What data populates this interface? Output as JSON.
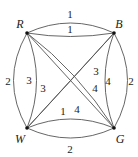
{
  "diagram": {
    "type": "weighted multigraph",
    "vertices": [
      {
        "id": "R",
        "label": "R",
        "x": 27,
        "y": 33,
        "lx": 20,
        "ly": 24
      },
      {
        "id": "B",
        "label": "B",
        "x": 114,
        "y": 33,
        "lx": 119,
        "ly": 24
      },
      {
        "id": "W",
        "label": "W",
        "x": 27,
        "y": 128,
        "lx": 20,
        "ly": 138
      },
      {
        "id": "G",
        "label": "G",
        "x": 114,
        "y": 128,
        "lx": 120,
        "ly": 138
      }
    ],
    "edges": [
      {
        "from": "R",
        "to": "B",
        "weight": "1",
        "kind": "outer-top"
      },
      {
        "from": "R",
        "to": "B",
        "weight": "1",
        "kind": "inner-top"
      },
      {
        "from": "R",
        "to": "W",
        "weight": "2",
        "kind": "outer-left"
      },
      {
        "from": "R",
        "to": "W",
        "weight": "3",
        "kind": "inner-left"
      },
      {
        "from": "B",
        "to": "G",
        "weight": "2",
        "kind": "outer-right"
      },
      {
        "from": "B",
        "to": "G",
        "weight": "4",
        "kind": "inner-right"
      },
      {
        "from": "W",
        "to": "G",
        "weight": "2",
        "kind": "outer-bottom"
      },
      {
        "from": "W",
        "to": "G",
        "weight": "1",
        "kind": "inner-bottom"
      },
      {
        "from": "R",
        "to": "G",
        "weight": "4",
        "kind": "diagonal-a"
      },
      {
        "from": "R",
        "to": "G",
        "weight": "4",
        "kind": "diagonal-b"
      },
      {
        "from": "B",
        "to": "W",
        "weight": "3",
        "kind": "diagonal-a"
      },
      {
        "from": "B",
        "to": "W",
        "weight": "3",
        "kind": "diagonal-b"
      }
    ],
    "labels": {
      "top_outer": "1",
      "top_inner": "1",
      "left_outer": "2",
      "left_inner": "3",
      "right_outer": "2",
      "right_inner": "4",
      "bottom_outer": "2",
      "bottom_inner": "1",
      "diag_bw_upper": "3",
      "diag_bw_lower": "3",
      "diag_rg_upper": "4",
      "diag_rg_lower": "4"
    },
    "colors": {
      "edge": "#555555",
      "vertex": "#111111",
      "text": "#222222"
    }
  }
}
